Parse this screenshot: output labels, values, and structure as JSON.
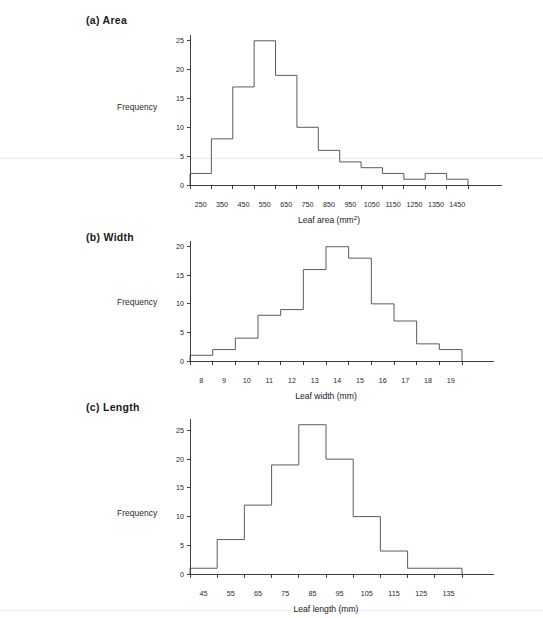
{
  "figure": {
    "background": "#ffffff",
    "line_color": "#4a4a4a",
    "axis_color": "#2b2b2b"
  },
  "panels": [
    {
      "title": "(a)  Area",
      "ylabel": "Frequency"
    },
    {
      "title": "(b)  Width",
      "ylabel": "Frequency"
    },
    {
      "title": "(c)  Length",
      "ylabel": "Frequency"
    }
  ],
  "chart_data": [
    {
      "type": "bar",
      "title": "(a)  Area",
      "xlabel": "Leaf area (mm²)",
      "ylabel": "Frequency",
      "bin_edges": [
        200,
        300,
        400,
        500,
        600,
        700,
        800,
        900,
        1000,
        1100,
        1200,
        1300,
        1400,
        1500
      ],
      "categories": [
        "250",
        "350",
        "450",
        "550",
        "650",
        "750",
        "850",
        "950",
        "1050",
        "1150",
        "1250",
        "1350",
        "1450"
      ],
      "values": [
        2,
        8,
        17,
        25,
        19,
        10,
        6,
        4,
        3,
        2,
        1,
        2,
        1
      ],
      "xticks": [
        250,
        350,
        450,
        550,
        650,
        750,
        850,
        950,
        1050,
        1150,
        1250,
        1350,
        1450
      ],
      "yticks": [
        0,
        5,
        10,
        15,
        20,
        25
      ],
      "xlim": [
        200,
        1560
      ],
      "ylim": [
        0,
        26
      ],
      "grid": false,
      "legend": "none"
    },
    {
      "type": "bar",
      "title": "(b)  Width",
      "xlabel": "Leaf width (mm)",
      "ylabel": "Frequency",
      "bin_edges": [
        7.5,
        8.5,
        9.5,
        10.5,
        11.5,
        12.5,
        13.5,
        14.5,
        15.5,
        16.5,
        17.5,
        18.5,
        19.5
      ],
      "categories": [
        "8",
        "9",
        "10",
        "11",
        "12",
        "13",
        "14",
        "15",
        "16",
        "17",
        "18",
        "19"
      ],
      "values": [
        1,
        2,
        4,
        8,
        9,
        16,
        20,
        18,
        10,
        7,
        3,
        2
      ],
      "xticks": [
        8,
        9,
        10,
        11,
        12,
        13,
        14,
        15,
        16,
        17,
        18,
        19
      ],
      "yticks": [
        0,
        5,
        10,
        15,
        20
      ],
      "xlim": [
        7.5,
        20.6
      ],
      "ylim": [
        0,
        21
      ],
      "grid": false,
      "legend": "none"
    },
    {
      "type": "bar",
      "title": "(c)  Length",
      "xlabel": "Leaf length (mm)",
      "ylabel": "Frequency",
      "bin_edges": [
        40,
        50,
        60,
        70,
        80,
        90,
        100,
        110,
        120,
        130,
        140
      ],
      "categories": [
        "45",
        "55",
        "65",
        "75",
        "85",
        "95",
        "105",
        "115",
        "125",
        "135"
      ],
      "values": [
        1,
        6,
        12,
        19,
        26,
        20,
        10,
        4,
        1,
        1
      ],
      "xticks": [
        45,
        55,
        65,
        75,
        85,
        95,
        105,
        115,
        125,
        135
      ],
      "yticks": [
        0,
        5,
        10,
        15,
        20,
        25
      ],
      "xlim": [
        40,
        150
      ],
      "ylim": [
        0,
        27
      ],
      "grid": false,
      "legend": "none"
    }
  ]
}
